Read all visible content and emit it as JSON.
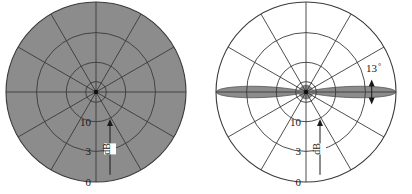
{
  "figure": {
    "background_color": "#ffffff",
    "grid_color": "#3a3a3a",
    "fill_color": "#8c8c8c",
    "text_color": "#1a1a1a"
  },
  "chart_data": {
    "type": "line",
    "title": "",
    "subtitle": "",
    "xlabel": "",
    "ylabel": "",
    "projection": "polar",
    "grid": true,
    "legend_position": "none",
    "panels": [
      {
        "name": "omnidirectional-pattern",
        "label": "",
        "center_x": 96,
        "center_y": 92,
        "radius": 90,
        "radial_ticks": [
          {
            "label": "0",
            "value": 0,
            "radius_frac": 1.0
          },
          {
            "label": "3",
            "value": 3,
            "radius_frac": 0.66
          },
          {
            "label": "10",
            "value": 10,
            "radius_frac": 0.33
          }
        ],
        "radial_unit": "dB",
        "angular_step_deg": 30,
        "angular_spokes": 12,
        "ring_radius_fracs": [
          0.115,
          0.33,
          0.66,
          1.0
        ],
        "pattern": {
          "description": "omnidirectional",
          "filled": true,
          "angles_deg": [
            0,
            30,
            60,
            90,
            120,
            150,
            180,
            210,
            240,
            270,
            300,
            330
          ],
          "values_frac": [
            1,
            1,
            1,
            1,
            1,
            1,
            1,
            1,
            1,
            1,
            1,
            1
          ]
        },
        "annotations": []
      },
      {
        "name": "directional-pattern",
        "label": "",
        "center_x": 306,
        "center_y": 92,
        "radius": 90,
        "radial_ticks": [
          {
            "label": "0",
            "value": 0,
            "radius_frac": 1.0
          },
          {
            "label": "3",
            "value": 3,
            "radius_frac": 0.66
          },
          {
            "label": "10",
            "value": 10,
            "radius_frac": 0.33
          }
        ],
        "radial_unit": "dB",
        "angular_step_deg": 30,
        "angular_spokes": 12,
        "ring_radius_fracs": [
          0.115,
          0.33,
          0.66,
          1.0
        ],
        "pattern": {
          "description": "bidirectional narrow beam",
          "filled": true,
          "beamwidth_deg": 13,
          "main_lobe_angles_deg": [
            0,
            180
          ],
          "angles_deg": [
            0,
            3,
            6,
            9,
            12,
            15,
            20,
            30,
            45,
            60,
            90,
            120,
            150,
            165,
            171,
            174,
            177,
            180
          ],
          "values_frac": [
            1.0,
            0.96,
            0.86,
            0.72,
            0.56,
            0.4,
            0.26,
            0.15,
            0.1,
            0.09,
            0.085,
            0.09,
            0.1,
            0.15,
            0.4,
            0.72,
            0.96,
            1.0
          ]
        },
        "annotations": [
          {
            "name": "beamwidth-annotation",
            "text": "13",
            "symbol": "°",
            "x": 366,
            "y": 72
          }
        ]
      }
    ]
  }
}
